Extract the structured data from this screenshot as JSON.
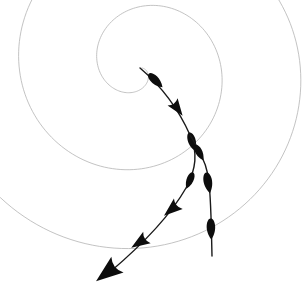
{
  "figure": {
    "width": 307,
    "height": 292,
    "background_color": "#ffffff"
  },
  "colors": {
    "spiral_stroke": "#b4b4b4",
    "trajectory_stroke": "#1a1a1a",
    "arrow_fill": "#0d0d0d",
    "background": "#ffffff"
  },
  "spiral": {
    "name": "archimedean-spiral",
    "center_x": 140,
    "center_y": 68,
    "stroke_width": 0.8,
    "turns_visible": 4,
    "direction": "counterclockwise-outward",
    "a": 2.0,
    "b": 12.6,
    "theta_start_deg": 0,
    "theta_end_deg": 1080,
    "paths": [
      "M 161.6 71.2 C 161.6 55.3 149.5 42.5 134.6 42.5 C 119.7 42.5 107.6 55.3 107.6 71.2 C 107.6 87.1 119.7 99.9 134.6 99.9 C 152.0 99.9 166.0 85.1 166.0 66.7",
      "M 191.9 66.0 C 191.9 34.6 167.3 9.2 137.0 9.2 C 106.7 9.2 82.1 34.6 82.1 66.0 C 82.1 97.4 106.7 122.8 137.0 122.8 C 172.0 122.8 200.3 93.1 200.3 56.2",
      "M 243.0 61.5 C 243.0 7.0 196.5 -37.2 139.2 -37.2 C 81.9 -37.2 35.4 7.0 35.4 61.5 C 35.4 116.0 81.9 160.2 139.2 160.2 C 200.5 160.2 250.0 108.9 250.0 45.5",
      "M 283.0 52.0 C 283.0 -25.0 218.0 -88.0 138.0 -88.0 C 58.0 -88.0 -7.0 -25.0 -7.0 52.0 C -7.0 129.0 58.0 192.0 138.0 192.0 C 222.0 192.0 290.0 122.0 290.0 36.0"
    ],
    "arc_segments": [
      {
        "name": "innermost-turn",
        "radius_px": 28,
        "visible": true
      },
      {
        "name": "second-turn",
        "radius_px": 57,
        "visible": true
      },
      {
        "name": "third-turn",
        "radius_px": 100,
        "visible": true
      },
      {
        "name": "outer-turn",
        "radius_px": 142,
        "visible": true
      }
    ]
  },
  "trajectories": [
    {
      "name": "trajectory-left",
      "label": "Trajectory A",
      "stroke_width": 1.4,
      "start": {
        "x": 140,
        "y": 68
      },
      "end": {
        "x": 105,
        "y": 275
      },
      "path": "M 140 68 C 160 85, 178 108, 190 135 C 198 152, 196 170, 186 188 C 174 209, 150 238, 110 272",
      "arrows": [
        {
          "index": 0,
          "x": 155,
          "y": 80,
          "angle_deg": 44,
          "style": "teardrop",
          "size": 11
        },
        {
          "index": 1,
          "x": 177,
          "y": 108,
          "angle_deg": 54,
          "style": "triangle",
          "size": 10
        },
        {
          "index": 2,
          "x": 192,
          "y": 141,
          "angle_deg": 73,
          "style": "teardrop",
          "size": 11
        },
        {
          "index": 3,
          "x": 190,
          "y": 180,
          "angle_deg": 112,
          "style": "teardrop",
          "size": 10
        },
        {
          "index": 4,
          "x": 172,
          "y": 209,
          "angle_deg": 140,
          "style": "triangle",
          "size": 11
        },
        {
          "index": 5,
          "x": 140,
          "y": 242,
          "angle_deg": 147,
          "style": "triangle",
          "size": 11
        },
        {
          "index": 6,
          "x": 108,
          "y": 272,
          "angle_deg": 142,
          "style": "triangle-large",
          "size": 16
        }
      ]
    },
    {
      "name": "trajectory-right",
      "label": "Trajectory B",
      "stroke_width": 1.4,
      "start": {
        "x": 190,
        "y": 135
      },
      "end": {
        "x": 212,
        "y": 256
      },
      "path": "M 190 135 C 198 148, 205 160, 208 175 C 211 192, 211 214, 212 256",
      "arrows": [
        {
          "index": 0,
          "x": 199,
          "y": 152,
          "angle_deg": 62,
          "style": "teardrop",
          "size": 10
        },
        {
          "index": 1,
          "x": 208,
          "y": 182,
          "angle_deg": 80,
          "style": "teardrop",
          "size": 12
        },
        {
          "index": 2,
          "x": 211,
          "y": 228,
          "angle_deg": 88,
          "style": "teardrop",
          "size": 12
        }
      ]
    }
  ],
  "legend": {
    "visible": false,
    "entries": []
  },
  "axes": {
    "visible": false
  }
}
